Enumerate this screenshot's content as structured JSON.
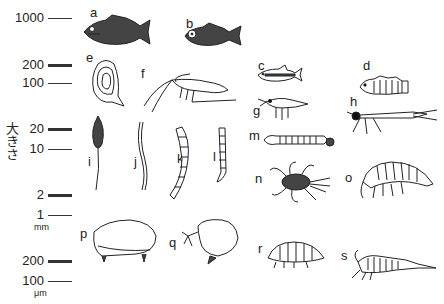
{
  "axis": {
    "label_chars": [
      "大",
      "き",
      "さ"
    ],
    "label": "大きさ",
    "ticks": [
      {
        "value": "1000",
        "y": 18,
        "style": "thin"
      },
      {
        "value": "200",
        "y": 65,
        "style": "thick"
      },
      {
        "value": "100",
        "y": 83,
        "style": "thin"
      },
      {
        "value": "20",
        "y": 129,
        "style": "thick"
      },
      {
        "value": "10",
        "y": 149,
        "style": "thin"
      },
      {
        "value": "2",
        "y": 195,
        "style": "thick"
      },
      {
        "value": "1",
        "y": 215,
        "style": "thin"
      },
      {
        "value": "200",
        "y": 261,
        "style": "thick"
      },
      {
        "value": "100",
        "y": 281,
        "style": "thin"
      }
    ],
    "units": [
      {
        "text": "mm",
        "y": 226
      },
      {
        "text": "μm",
        "y": 292
      }
    ]
  },
  "organisms": [
    {
      "letter": "a",
      "kind": "fish (bass)"
    },
    {
      "letter": "b",
      "kind": "fish (carp)"
    },
    {
      "letter": "c",
      "kind": "fish (minnow)"
    },
    {
      "letter": "d",
      "kind": "fish (goby)"
    },
    {
      "letter": "e",
      "kind": "bivalve shell"
    },
    {
      "letter": "f",
      "kind": "shrimp"
    },
    {
      "letter": "g",
      "kind": "aquatic larva"
    },
    {
      "letter": "h",
      "kind": "aquatic insect larva"
    },
    {
      "letter": "i",
      "kind": "leech"
    },
    {
      "letter": "j",
      "kind": "worm"
    },
    {
      "letter": "k",
      "kind": "chironomid larva"
    },
    {
      "letter": "l",
      "kind": "small larva"
    },
    {
      "letter": "m",
      "kind": "segmented larva"
    },
    {
      "letter": "n",
      "kind": "water mite / beetle larva"
    },
    {
      "letter": "o",
      "kind": "amphipod"
    },
    {
      "letter": "p",
      "kind": "ostracod"
    },
    {
      "letter": "q",
      "kind": "cladoceran"
    },
    {
      "letter": "r",
      "kind": "isopod-like crustacean"
    },
    {
      "letter": "s",
      "kind": "copepod-like crustacean"
    }
  ]
}
